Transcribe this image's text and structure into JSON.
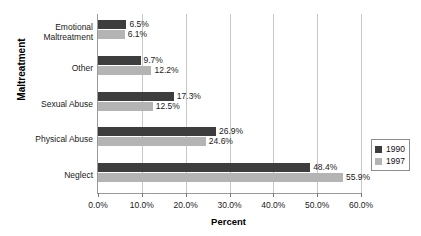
{
  "chart_data": {
    "type": "bar",
    "orientation": "horizontal",
    "title": "",
    "xlabel": "Percent",
    "ylabel": "Maltreatment",
    "categories": [
      "Emotional Maltreatment",
      "Other",
      "Sexual Abuse",
      "Physical Abuse",
      "Neglect"
    ],
    "category_lines": [
      [
        "Emotional",
        "Maltreatment"
      ],
      [
        "Other"
      ],
      [
        "Sexual Abuse"
      ],
      [
        "Physical Abuse"
      ],
      [
        "Neglect"
      ]
    ],
    "series": [
      {
        "name": "1990",
        "color": "#3d3d3d",
        "values": [
          6.5,
          9.7,
          17.3,
          26.9,
          48.4
        ],
        "labels": [
          "6.5%",
          "9.7%",
          "17.3%",
          "26.9%",
          "48.4%"
        ]
      },
      {
        "name": "1997",
        "color": "#b4b4b4",
        "values": [
          6.1,
          12.2,
          12.5,
          24.6,
          55.9
        ],
        "labels": [
          "6.1%",
          "12.2%",
          "12.5%",
          "24.6%",
          "55.9%"
        ]
      }
    ],
    "xlim": [
      0,
      60
    ],
    "xticks": [
      0,
      10,
      20,
      30,
      40,
      50,
      60
    ],
    "xtick_labels": [
      "0.0%",
      "10.0%",
      "20.0%",
      "30.0%",
      "40.0%",
      "50.0%",
      "60.0%"
    ],
    "grid": true,
    "legend_position": "right"
  },
  "legend": {
    "entries": [
      {
        "label": "1990"
      },
      {
        "label": "1997"
      }
    ]
  }
}
